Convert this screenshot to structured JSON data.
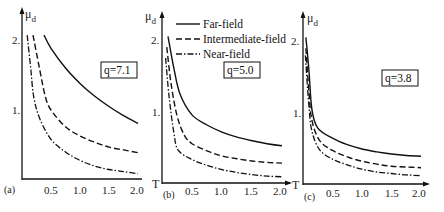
{
  "figure": {
    "legend": {
      "entries": [
        {
          "label": "Far-field",
          "style": "solid"
        },
        {
          "label": "Intermediate-field",
          "style": "dashed"
        },
        {
          "label": "Near-field",
          "style": "dash-dot"
        }
      ]
    },
    "panels": [
      {
        "id": "a",
        "panel_label": "(a)",
        "q_label": "q=7.1",
        "ylabel": "μ",
        "ylabel_sub": "d",
        "xlabel": "",
        "yticks": [
          "1.",
          "2."
        ],
        "xticks": [
          "0.5",
          "1.0",
          "1.5",
          "2.0"
        ]
      },
      {
        "id": "b",
        "panel_label": "(b)",
        "q_label": "q=5.0",
        "ylabel": "μ",
        "ylabel_sub": "d",
        "xlabel": "T",
        "yticks": [
          "1.",
          "2."
        ],
        "xticks": [
          "0.5",
          "1.0",
          "1.5",
          "2.0"
        ]
      },
      {
        "id": "c",
        "panel_label": "(c)",
        "q_label": "q=3.8",
        "ylabel": "μ",
        "ylabel_sub": "d",
        "xlabel": "T",
        "yticks": [
          "1.",
          "2."
        ],
        "xticks": [
          "0.5",
          "1.0",
          "1.5",
          "2.0"
        ]
      }
    ]
  },
  "chart_data": [
    {
      "type": "line",
      "title": "(a) q=7.1",
      "xlabel": "T",
      "ylabel": "μd",
      "xlim": [
        0,
        2.0
      ],
      "ylim": [
        0,
        2.2
      ],
      "xticks": [
        0.5,
        1.0,
        1.5,
        2.0
      ],
      "yticks": [
        1,
        2
      ],
      "grid": false,
      "legend_position": "none (shared legend in panel b)",
      "series": [
        {
          "name": "Far-field",
          "style": "solid",
          "x": [
            0.38,
            0.5,
            0.75,
            1.0,
            1.25,
            1.5,
            1.75,
            2.0
          ],
          "y": [
            2.07,
            1.88,
            1.6,
            1.38,
            1.2,
            1.05,
            0.92,
            0.81
          ]
        },
        {
          "name": "Intermediate-field",
          "style": "dashed",
          "x": [
            0.19,
            0.3,
            0.4,
            0.5,
            0.75,
            1.0,
            1.25,
            1.5,
            1.75,
            2.0
          ],
          "y": [
            2.07,
            1.6,
            1.2,
            1.0,
            0.76,
            0.63,
            0.54,
            0.47,
            0.43,
            0.39
          ]
        },
        {
          "name": "Near-field",
          "style": "dash-dot",
          "x": [
            0.09,
            0.15,
            0.2,
            0.3,
            0.5,
            0.75,
            1.0,
            1.25,
            1.5,
            1.75,
            2.0
          ],
          "y": [
            2.07,
            1.6,
            1.2,
            0.89,
            0.58,
            0.4,
            0.28,
            0.2,
            0.15,
            0.12,
            0.09
          ]
        }
      ]
    },
    {
      "type": "line",
      "title": "(b) q=5.0",
      "xlabel": "T",
      "ylabel": "μd",
      "xlim": [
        0,
        2.0
      ],
      "ylim": [
        0,
        2.2
      ],
      "xticks": [
        0.5,
        1.0,
        1.5,
        2.0
      ],
      "yticks": [
        1,
        2
      ],
      "grid": false,
      "legend_position": "upper right",
      "series": [
        {
          "name": "Far-field",
          "style": "solid",
          "x": [
            0.1,
            0.2,
            0.3,
            0.5,
            0.75,
            1.0,
            1.25,
            1.5,
            1.75,
            2.0
          ],
          "y": [
            2.05,
            1.6,
            1.25,
            0.96,
            0.82,
            0.72,
            0.65,
            0.6,
            0.56,
            0.53
          ]
        },
        {
          "name": "Intermediate-field",
          "style": "dashed",
          "x": [
            0.08,
            0.15,
            0.25,
            0.37,
            0.5,
            0.75,
            1.0,
            1.25,
            1.5,
            1.75,
            2.0
          ],
          "y": [
            1.9,
            1.4,
            0.95,
            0.68,
            0.56,
            0.46,
            0.39,
            0.35,
            0.32,
            0.3,
            0.29
          ]
        },
        {
          "name": "Near-field",
          "style": "dash-dot",
          "x": [
            0.06,
            0.12,
            0.2,
            0.27,
            0.5,
            0.75,
            1.0,
            1.25,
            1.5,
            1.75,
            2.0
          ],
          "y": [
            1.75,
            1.2,
            0.7,
            0.47,
            0.34,
            0.26,
            0.2,
            0.16,
            0.13,
            0.11,
            0.1
          ]
        }
      ]
    },
    {
      "type": "line",
      "title": "(c) q=3.8",
      "xlabel": "T",
      "ylabel": "μd",
      "xlim": [
        0,
        2.0
      ],
      "ylim": [
        0,
        2.2
      ],
      "xticks": [
        0.5,
        1.0,
        1.5,
        2.0
      ],
      "yticks": [
        1,
        2
      ],
      "grid": false,
      "legend_position": "none (shared legend in panel b)",
      "series": [
        {
          "name": "Far-field",
          "style": "solid",
          "x": [
            0.05,
            0.1,
            0.15,
            0.25,
            0.5,
            0.75,
            1.0,
            1.25,
            1.5,
            1.75,
            2.0
          ],
          "y": [
            2.05,
            1.6,
            1.05,
            0.79,
            0.65,
            0.56,
            0.5,
            0.46,
            0.43,
            0.41,
            0.4
          ]
        },
        {
          "name": "Intermediate-field",
          "style": "dashed",
          "x": [
            0.05,
            0.1,
            0.15,
            0.28,
            0.5,
            0.75,
            1.0,
            1.25,
            1.5,
            1.75,
            2.0
          ],
          "y": [
            1.9,
            1.3,
            0.9,
            0.62,
            0.48,
            0.39,
            0.33,
            0.29,
            0.26,
            0.25,
            0.24
          ]
        },
        {
          "name": "Near-field",
          "style": "dash-dot",
          "x": [
            0.04,
            0.1,
            0.15,
            0.28,
            0.5,
            0.75,
            1.0,
            1.25,
            1.5,
            1.75,
            2.0
          ],
          "y": [
            1.8,
            1.1,
            0.75,
            0.49,
            0.36,
            0.28,
            0.22,
            0.18,
            0.16,
            0.14,
            0.13
          ]
        }
      ]
    }
  ]
}
